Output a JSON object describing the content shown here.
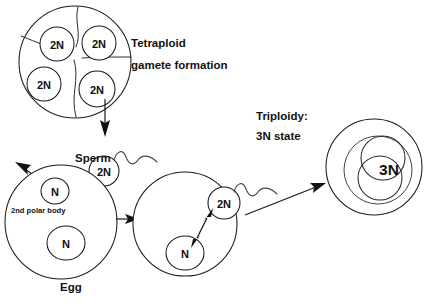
{
  "figure": {
    "title_visible": false,
    "background_color": "#ffffff",
    "stroke_color": "#1a1a1a",
    "text_color": "#111111"
  },
  "annotations": {
    "tetraploid_line1": "Tetraploid",
    "tetraploid_line2": "gamete formation",
    "sperm_label": "Sperm",
    "polar_body_label": "2nd polar body",
    "egg_label": "Egg",
    "triploidy_line1": "Triploidy:",
    "triploidy_line2": "3N state"
  },
  "cells": {
    "tetraploid": {
      "name": "tetraploid-gamete-cell",
      "nuclei_labels": [
        "2N",
        "2N",
        "2N",
        "2N"
      ],
      "nuclei_count": 4
    },
    "sperm": {
      "name": "sperm-cell",
      "head_label": "2N",
      "has_flagellum": true
    },
    "egg": {
      "name": "egg-cell",
      "polar_body_label": "N",
      "nucleus_label": "N"
    },
    "fertilized": {
      "name": "fertilized-egg-cell",
      "egg_nucleus_label": "N",
      "sperm_nucleus_label": "2N",
      "has_flagellum": true,
      "fusion_arrow": "double-headed"
    },
    "zygote": {
      "name": "triploid-zygote-cell",
      "nucleus_label": "3N"
    }
  },
  "arrows": [
    {
      "name": "gamete-release-arrow",
      "direction": "down",
      "from": "tetraploid-gamete-cell",
      "to": "sperm-cell"
    },
    {
      "name": "polar-body-extrusion-arrow",
      "direction": "up-left",
      "from": "egg-polar-body"
    },
    {
      "name": "fertilization-arrow",
      "direction": "right",
      "from": "egg-cell",
      "to": "fertilized-egg-cell"
    },
    {
      "name": "zygote-formation-arrow",
      "direction": "up-right",
      "from": "fertilized-egg-cell",
      "to": "triploid-zygote-cell"
    }
  ]
}
